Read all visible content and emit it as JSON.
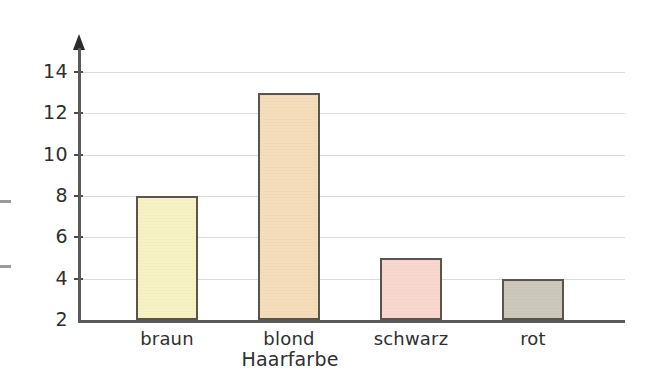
{
  "chart_data": {
    "type": "bar",
    "title": "",
    "subtitle": "",
    "xlabel": "Haarfarbe",
    "ylabel": "",
    "categories": [
      "braun",
      "blond",
      "schwarz",
      "rot"
    ],
    "values": [
      8,
      13,
      5,
      4
    ],
    "series": [
      {
        "name": "Haarfarbe",
        "values": [
          8,
          13,
          5,
          4
        ]
      }
    ],
    "ylim": [
      2,
      14
    ],
    "ytick_labels": [
      "14",
      "12",
      "10",
      "8",
      "6",
      "4",
      "2"
    ],
    "ytick_values": [
      14,
      12,
      10,
      8,
      6,
      4,
      2
    ],
    "grid": true,
    "legend": "none",
    "axis_arrow": "up",
    "bar_colors": [
      "#F7F2C4",
      "#F5DCBB",
      "#F8D7CE",
      "#CCC8BC"
    ],
    "bar_border_color": "#59554b",
    "gridline_color": "#dcdcdc",
    "axis_color": "#5a5a58",
    "background_color": "#ffffff",
    "text_color": "#2f2f2f"
  },
  "bars": [
    {
      "label": "braun",
      "value": 8,
      "color": "#F7F2C4"
    },
    {
      "label": "blond",
      "value": 13,
      "color": "#F5DCBB"
    },
    {
      "label": "schwarz",
      "value": 5,
      "color": "#F8D7CE"
    },
    {
      "label": "rot",
      "value": 4,
      "color": "#CCC8BC"
    }
  ],
  "yticks": [
    {
      "label": "14",
      "value": 14
    },
    {
      "label": "12",
      "value": 12
    },
    {
      "label": "10",
      "value": 10
    },
    {
      "label": "8",
      "value": 8
    },
    {
      "label": "6",
      "value": 6
    },
    {
      "label": "4",
      "value": 4
    },
    {
      "label": "2",
      "value": 2
    }
  ],
  "axis": {
    "x_title": "Haarfarbe"
  }
}
